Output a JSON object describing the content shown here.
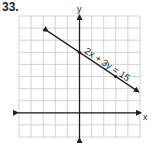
{
  "problem": {
    "number": "33."
  },
  "chart_data": {
    "type": "line",
    "title": "",
    "xlabel": "x",
    "ylabel": "y",
    "xlim": [
      -5,
      5
    ],
    "ylim": [
      -2,
      8
    ],
    "grid": true,
    "grid_step": 1,
    "series": [
      {
        "name": "2x + 3y = 15",
        "equation": "2x + 3y = 15",
        "slope": -0.6667,
        "y_intercept": 5,
        "x": [
          -2.6,
          0,
          3,
          4.9
        ],
        "y": [
          6.73,
          5,
          3,
          1.73
        ],
        "marked_points": [
          [
            0,
            5
          ],
          [
            3,
            3
          ]
        ],
        "arrows": "both ends"
      }
    ],
    "annotations": [
      {
        "text": "2x + 3y = 15",
        "position": "along line, above"
      }
    ]
  },
  "labels": {
    "x_axis": "x",
    "y_axis": "y",
    "equation": "2x + 3y = 15"
  },
  "colors": {
    "grid": "#c8c8c8",
    "axes": "#231f20",
    "line": "#231f20"
  }
}
